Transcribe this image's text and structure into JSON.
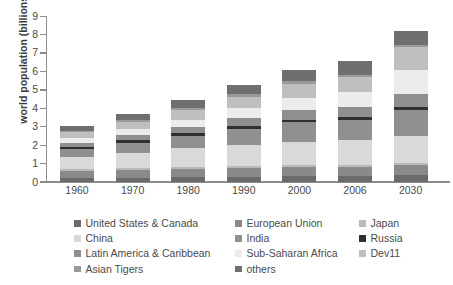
{
  "chart_data": {
    "type": "bar",
    "stacked": true,
    "title": "",
    "xlabel": "",
    "ylabel": "world population (billions)",
    "ylim": [
      0,
      9
    ],
    "ytick_labels": [
      "0",
      "1",
      "2",
      "3",
      "4",
      "5",
      "6",
      "7",
      "8",
      "9"
    ],
    "yticks": [
      0,
      1,
      2,
      3,
      4,
      5,
      6,
      7,
      8,
      9
    ],
    "grid": false,
    "legend_position": "bottom",
    "categories": [
      "1960",
      "1970",
      "1980",
      "1990",
      "2000",
      "2006",
      "2030"
    ],
    "series": [
      {
        "name": "United States & Canada",
        "color": "#6b6b6b",
        "values": [
          0.2,
          0.23,
          0.25,
          0.28,
          0.31,
          0.33,
          0.4
        ]
      },
      {
        "name": "European Union",
        "color": "#8a8a8a",
        "values": [
          0.4,
          0.44,
          0.47,
          0.48,
          0.48,
          0.49,
          0.5
        ]
      },
      {
        "name": "Japan",
        "color": "#b9b9b9",
        "values": [
          0.09,
          0.1,
          0.12,
          0.12,
          0.13,
          0.13,
          0.12
        ]
      },
      {
        "name": "China",
        "color": "#d9d9d9",
        "values": [
          0.66,
          0.82,
          0.98,
          1.14,
          1.26,
          1.31,
          1.45
        ]
      },
      {
        "name": "India",
        "color": "#909090",
        "values": [
          0.45,
          0.55,
          0.69,
          0.87,
          1.05,
          1.13,
          1.46
        ]
      },
      {
        "name": "Russia",
        "color": "#303030",
        "values": [
          0.12,
          0.13,
          0.14,
          0.15,
          0.15,
          0.14,
          0.13
        ]
      },
      {
        "name": "Latin America & Caribbean",
        "color": "#8f8f8f",
        "values": [
          0.22,
          0.29,
          0.36,
          0.44,
          0.52,
          0.56,
          0.7
        ]
      },
      {
        "name": "Sub-Saharan Africa",
        "color": "#ececec",
        "values": [
          0.23,
          0.29,
          0.38,
          0.51,
          0.67,
          0.77,
          1.34
        ]
      },
      {
        "name": "Dev11",
        "color": "#bfbfbf",
        "values": [
          0.33,
          0.41,
          0.52,
          0.64,
          0.77,
          0.84,
          1.2
        ]
      },
      {
        "name": "Asian Tigers",
        "color": "#9a9a9a",
        "values": [
          0.07,
          0.09,
          0.1,
          0.12,
          0.13,
          0.13,
          0.14
        ]
      },
      {
        "name": "others",
        "color": "#6f6f6f",
        "values": [
          0.28,
          0.33,
          0.43,
          0.53,
          0.61,
          0.72,
          0.76
        ]
      }
    ],
    "totals": [
      3.05,
      3.68,
      4.44,
      5.28,
      6.08,
      6.55,
      8.2
    ]
  },
  "axes": {
    "y_title": "world population (billions)"
  },
  "legend": {
    "entries": [
      {
        "label": "United States & Canada",
        "color": "#6b6b6b"
      },
      {
        "label": "European Union",
        "color": "#8a8a8a"
      },
      {
        "label": "Japan",
        "color": "#b9b9b9"
      },
      {
        "label": "China",
        "color": "#d9d9d9"
      },
      {
        "label": "India",
        "color": "#909090"
      },
      {
        "label": "Russia",
        "color": "#303030"
      },
      {
        "label": "Latin America & Caribbean",
        "color": "#8f8f8f"
      },
      {
        "label": "Sub-Saharan Africa",
        "color": "#ececec"
      },
      {
        "label": "Dev11",
        "color": "#bfbfbf"
      },
      {
        "label": "Asian Tigers",
        "color": "#9a9a9a"
      },
      {
        "label": "others",
        "color": "#6f6f6f"
      }
    ]
  }
}
